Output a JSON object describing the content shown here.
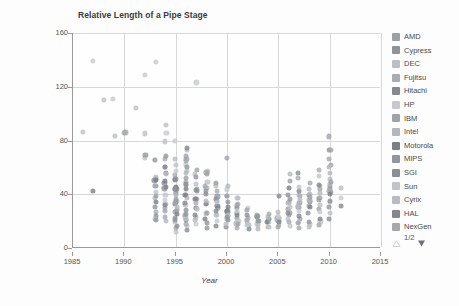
{
  "chart_data": {
    "type": "scatter",
    "title": "Relative Length of a Pipe Stage",
    "xlabel": "Year",
    "ylabel": "FO4 per Cycle",
    "xlim": [
      1985,
      2015
    ],
    "ylim": [
      0,
      160
    ],
    "xticks": [
      1985,
      1990,
      1995,
      2000,
      2005,
      2010,
      2015
    ],
    "yticks": [
      0,
      40,
      80,
      120,
      160
    ],
    "grid": true,
    "legend_position": "right",
    "series": [
      {
        "name": "AMD",
        "color": "#9aa0a6",
        "points": [
          [
            1996,
            47
          ],
          [
            1997,
            44
          ],
          [
            1999,
            36
          ],
          [
            2000,
            27
          ],
          [
            2000,
            25
          ],
          [
            2001,
            23
          ],
          [
            2002,
            21
          ],
          [
            2003,
            20
          ],
          [
            2004,
            20
          ],
          [
            2005,
            21
          ],
          [
            2006,
            27
          ],
          [
            2006,
            30
          ],
          [
            2007,
            30
          ],
          [
            2007,
            33
          ],
          [
            2008,
            34
          ],
          [
            2008,
            35
          ],
          [
            2009,
            36
          ],
          [
            2009,
            38
          ],
          [
            2010,
            44
          ],
          [
            2010,
            47
          ],
          [
            2010,
            41
          ],
          [
            2006,
            24
          ],
          [
            2007,
            22
          ],
          [
            2009,
            29
          ]
        ]
      },
      {
        "name": "Cypress",
        "color": "#8e9398",
        "points": [
          [
            1993,
            51
          ],
          [
            1994,
            45
          ],
          [
            1995,
            42
          ],
          [
            1995,
            33
          ]
        ]
      },
      {
        "name": "DEC",
        "color": "#bcc0c4",
        "points": [
          [
            1986,
            87
          ],
          [
            1988,
            111
          ],
          [
            1989,
            83
          ],
          [
            1990,
            86
          ],
          [
            1991,
            105
          ],
          [
            1992,
            86
          ],
          [
            1992,
            68
          ],
          [
            1993,
            66
          ],
          [
            1994,
            92
          ],
          [
            1994,
            80
          ],
          [
            1995,
            62
          ],
          [
            1996,
            74
          ],
          [
            1996,
            58
          ],
          [
            1997,
            55
          ],
          [
            1998,
            50
          ],
          [
            1999,
            46
          ]
        ]
      },
      {
        "name": "Fujitsu",
        "color": "#a8adb2",
        "points": [
          [
            1994,
            66
          ],
          [
            1995,
            55
          ],
          [
            1996,
            49
          ],
          [
            1998,
            44
          ],
          [
            2000,
            39
          ],
          [
            2001,
            33
          ],
          [
            2003,
            25
          ],
          [
            2005,
            22
          ],
          [
            2007,
            30
          ],
          [
            2008,
            32
          ],
          [
            2010,
            42
          ]
        ]
      },
      {
        "name": "Hitachi",
        "color": "#85898e",
        "points": [
          [
            1993,
            52
          ],
          [
            1994,
            48
          ],
          [
            1995,
            45
          ],
          [
            1996,
            40
          ],
          [
            1997,
            37
          ],
          [
            1999,
            30
          ],
          [
            2001,
            26
          ]
        ]
      },
      {
        "name": "HP",
        "color": "#c6cace",
        "points": [
          [
            1987,
            139
          ],
          [
            1989,
            111
          ],
          [
            1992,
            129
          ],
          [
            1993,
            139
          ],
          [
            1994,
            86
          ],
          [
            1995,
            80
          ],
          [
            1996,
            62
          ],
          [
            1997,
            123
          ],
          [
            1998,
            58
          ],
          [
            1999,
            48
          ],
          [
            2000,
            44
          ],
          [
            2001,
            38
          ],
          [
            2002,
            30
          ]
        ]
      },
      {
        "name": "IBM",
        "color": "#9fa4a9",
        "points": [
          [
            1990,
            86
          ],
          [
            1993,
            66
          ],
          [
            1994,
            60
          ],
          [
            1995,
            45
          ],
          [
            1996,
            66
          ],
          [
            1997,
            58
          ],
          [
            1998,
            57
          ],
          [
            1999,
            48
          ],
          [
            2000,
            67
          ],
          [
            2001,
            32
          ],
          [
            2002,
            28
          ],
          [
            2003,
            24
          ],
          [
            2004,
            22
          ],
          [
            2005,
            23
          ],
          [
            2006,
            34
          ],
          [
            2007,
            38
          ],
          [
            2008,
            40
          ],
          [
            2009,
            44
          ],
          [
            2010,
            62
          ],
          [
            2010,
            72
          ],
          [
            2010,
            83
          ]
        ]
      },
      {
        "name": "Intel",
        "color": "#b3b8bc",
        "points": [
          [
            1993,
            52
          ],
          [
            1994,
            47
          ],
          [
            1995,
            40
          ],
          [
            1996,
            38
          ],
          [
            1997,
            36
          ],
          [
            1998,
            33
          ],
          [
            1999,
            30
          ],
          [
            2000,
            22
          ],
          [
            2001,
            19
          ],
          [
            2002,
            17
          ],
          [
            2003,
            18
          ],
          [
            2004,
            19
          ],
          [
            2005,
            21
          ],
          [
            2006,
            28
          ],
          [
            2006,
            33
          ],
          [
            2007,
            36
          ],
          [
            2007,
            40
          ],
          [
            2008,
            40
          ],
          [
            2008,
            36
          ],
          [
            2009,
            42
          ],
          [
            2009,
            46
          ],
          [
            2010,
            48
          ],
          [
            2010,
            52
          ],
          [
            2010,
            56
          ],
          [
            2005,
            17
          ],
          [
            2004,
            16
          ],
          [
            2003,
            15
          ]
        ]
      },
      {
        "name": "Motorola",
        "color": "#7b8085",
        "points": [
          [
            1987,
            43
          ],
          [
            1993,
            51
          ],
          [
            1994,
            50
          ],
          [
            1994,
            45
          ],
          [
            1995,
            45
          ],
          [
            1995,
            44
          ],
          [
            1996,
            40
          ],
          [
            1997,
            36
          ],
          [
            1998,
            33
          ],
          [
            1999,
            31
          ],
          [
            2000,
            28
          ]
        ]
      },
      {
        "name": "MIPS",
        "color": "#9097a0",
        "points": [
          [
            1992,
            69
          ],
          [
            1993,
            46
          ],
          [
            1994,
            68
          ],
          [
            1995,
            44
          ],
          [
            1996,
            60
          ],
          [
            1997,
            52
          ],
          [
            1998,
            43
          ],
          [
            1999,
            38
          ],
          [
            2000,
            34
          ],
          [
            2001,
            30
          ]
        ]
      },
      {
        "name": "SGI",
        "color": "#8a9097",
        "points": [
          [
            1994,
            56
          ],
          [
            1995,
            52
          ],
          [
            1996,
            48
          ],
          [
            1997,
            44
          ],
          [
            1998,
            40
          ],
          [
            1999,
            36
          ]
        ]
      },
      {
        "name": "Sun",
        "color": "#c0c4c8",
        "points": [
          [
            1993,
            41
          ],
          [
            1994,
            40
          ],
          [
            1995,
            36
          ],
          [
            1996,
            32
          ],
          [
            1997,
            29
          ],
          [
            1998,
            26
          ],
          [
            1999,
            25
          ],
          [
            2000,
            24
          ],
          [
            2001,
            21
          ],
          [
            2002,
            19
          ],
          [
            2003,
            18
          ],
          [
            2004,
            20
          ],
          [
            2005,
            22
          ],
          [
            2006,
            22
          ],
          [
            2007,
            19
          ],
          [
            2008,
            18
          ],
          [
            2009,
            20
          ],
          [
            2010,
            34
          ]
        ]
      },
      {
        "name": "Cyrix",
        "color": "#b8bcc0",
        "points": [
          [
            1993,
            37
          ],
          [
            1994,
            33
          ],
          [
            1995,
            28
          ],
          [
            1996,
            24
          ],
          [
            1997,
            22
          ]
        ]
      },
      {
        "name": "HAL",
        "color": "#83888d",
        "points": [
          [
            1995,
            35
          ],
          [
            1996,
            33
          ],
          [
            1997,
            30
          ]
        ]
      },
      {
        "name": "NexGen",
        "color": "#a4a9ae",
        "points": [
          [
            1994,
            30
          ],
          [
            1995,
            27
          ],
          [
            1996,
            25
          ]
        ]
      }
    ],
    "extra_points": [
      [
        1993,
        27
      ],
      [
        1993,
        24
      ],
      [
        1993,
        22
      ],
      [
        1993,
        20
      ],
      [
        1993,
        31
      ],
      [
        1993,
        35
      ],
      [
        1993,
        39
      ],
      [
        1994,
        20
      ],
      [
        1994,
        24
      ],
      [
        1994,
        28
      ],
      [
        1994,
        32
      ],
      [
        1994,
        36
      ],
      [
        1994,
        55
      ],
      [
        1994,
        60
      ],
      [
        1995,
        13
      ],
      [
        1995,
        15
      ],
      [
        1995,
        17
      ],
      [
        1995,
        19
      ],
      [
        1995,
        21
      ],
      [
        1995,
        23
      ],
      [
        1995,
        26
      ],
      [
        1995,
        29
      ],
      [
        1995,
        31
      ],
      [
        1995,
        34
      ],
      [
        1995,
        37
      ],
      [
        1995,
        50
      ],
      [
        1995,
        58
      ],
      [
        1995,
        66
      ],
      [
        1996,
        14
      ],
      [
        1996,
        16
      ],
      [
        1996,
        18
      ],
      [
        1996,
        20
      ],
      [
        1996,
        22
      ],
      [
        1996,
        26
      ],
      [
        1996,
        28
      ],
      [
        1996,
        44
      ],
      [
        1996,
        52
      ],
      [
        1996,
        56
      ],
      [
        1996,
        64
      ],
      [
        1996,
        69
      ],
      [
        1996,
        75
      ],
      [
        1997,
        18
      ],
      [
        1997,
        20
      ],
      [
        1997,
        24
      ],
      [
        1997,
        28
      ],
      [
        1997,
        33
      ],
      [
        1997,
        42
      ],
      [
        1997,
        47
      ],
      [
        1998,
        15
      ],
      [
        1998,
        19
      ],
      [
        1998,
        22
      ],
      [
        1998,
        26
      ],
      [
        1998,
        35
      ],
      [
        1998,
        46
      ],
      [
        1998,
        55
      ],
      [
        1999,
        17
      ],
      [
        1999,
        21
      ],
      [
        1999,
        25
      ],
      [
        1999,
        28
      ],
      [
        1999,
        34
      ],
      [
        1999,
        42
      ],
      [
        2000,
        16
      ],
      [
        2000,
        18
      ],
      [
        2000,
        21
      ],
      [
        2000,
        24
      ],
      [
        2000,
        30
      ],
      [
        2000,
        38
      ],
      [
        2000,
        46
      ],
      [
        2001,
        15
      ],
      [
        2001,
        18
      ],
      [
        2001,
        24
      ],
      [
        2001,
        28
      ],
      [
        2001,
        37
      ],
      [
        2002,
        14
      ],
      [
        2002,
        17
      ],
      [
        2002,
        22
      ],
      [
        2002,
        25
      ],
      [
        2003,
        19
      ],
      [
        2003,
        21
      ],
      [
        2003,
        23
      ],
      [
        2004,
        19
      ],
      [
        2004,
        21
      ],
      [
        2004,
        23
      ],
      [
        2004,
        26
      ],
      [
        2005,
        16
      ],
      [
        2005,
        19
      ],
      [
        2005,
        24
      ],
      [
        2005,
        27
      ],
      [
        2005,
        38
      ],
      [
        2006,
        17
      ],
      [
        2006,
        20
      ],
      [
        2006,
        26
      ],
      [
        2006,
        31
      ],
      [
        2006,
        36
      ],
      [
        2006,
        40
      ],
      [
        2006,
        44
      ],
      [
        2006,
        50
      ],
      [
        2006,
        55
      ],
      [
        2007,
        15
      ],
      [
        2007,
        18
      ],
      [
        2007,
        24
      ],
      [
        2007,
        28
      ],
      [
        2007,
        32
      ],
      [
        2007,
        42
      ],
      [
        2007,
        46
      ],
      [
        2007,
        52
      ],
      [
        2007,
        56
      ],
      [
        2008,
        16
      ],
      [
        2008,
        20
      ],
      [
        2008,
        26
      ],
      [
        2008,
        30
      ],
      [
        2008,
        38
      ],
      [
        2008,
        44
      ],
      [
        2008,
        48
      ],
      [
        2009,
        18
      ],
      [
        2009,
        22
      ],
      [
        2009,
        27
      ],
      [
        2009,
        32
      ],
      [
        2009,
        48
      ],
      [
        2009,
        54
      ],
      [
        2009,
        58
      ],
      [
        2010,
        22
      ],
      [
        2010,
        26
      ],
      [
        2010,
        30
      ],
      [
        2010,
        36
      ],
      [
        2010,
        40
      ],
      [
        2010,
        50
      ],
      [
        2010,
        60
      ],
      [
        2010,
        66
      ],
      [
        2010,
        74
      ],
      [
        2011,
        32
      ],
      [
        2011,
        38
      ],
      [
        2011,
        45
      ]
    ]
  },
  "legend": {
    "items": [
      {
        "label": "AMD",
        "color": "#9aa0a6"
      },
      {
        "label": "Cypress",
        "color": "#8e9398"
      },
      {
        "label": "DEC",
        "color": "#bcc0c4"
      },
      {
        "label": "Fujitsu",
        "color": "#a8adb2"
      },
      {
        "label": "Hitachi",
        "color": "#85898e"
      },
      {
        "label": "HP",
        "color": "#c6cace"
      },
      {
        "label": "IBM",
        "color": "#9fa4a9"
      },
      {
        "label": "Intel",
        "color": "#b3b8bc"
      },
      {
        "label": "Motorola",
        "color": "#7b8085"
      },
      {
        "label": "MIPS",
        "color": "#9097a0"
      },
      {
        "label": "SGI",
        "color": "#8a9097"
      },
      {
        "label": "Sun",
        "color": "#c0c4c8"
      },
      {
        "label": "Cyrix",
        "color": "#b8bcc0"
      },
      {
        "label": "HAL",
        "color": "#83888d"
      },
      {
        "label": "NexGen",
        "color": "#a4a9ae"
      }
    ],
    "pager": {
      "text": "1/2",
      "up_enabled": false,
      "down_enabled": true,
      "up_color": "#cfd2d5",
      "down_color": "#6e7276"
    }
  },
  "colors": {
    "background": "#fdfdfd",
    "plot_background": "#fefefe",
    "axis": "#9a9a9a",
    "grid": "#d8d8d8",
    "tick_text": "#555555",
    "title_text": "#3a3a3a",
    "axis_label_text": "#444444"
  }
}
